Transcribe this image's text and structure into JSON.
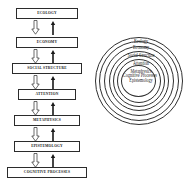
{
  "diagram": {
    "line_color": "#2b2b2b",
    "background_color": "#ffffff"
  },
  "flowchart": {
    "name": "hierarchical-flowchart",
    "down_arrow_style": "hollow-block-arrow",
    "up_arrow_style": "thin-solid-arrow",
    "boxes": [
      {
        "label": "ECOLOGY"
      },
      {
        "label": "ECONOMY"
      },
      {
        "label": "SOCIAL STRUCTURE"
      },
      {
        "label": "ATTENTION"
      },
      {
        "label": "METAPHYSICS"
      },
      {
        "label": "EPISTEMOLOGY"
      },
      {
        "label": "COGNITIVE PROCESSES"
      }
    ],
    "connectors": [
      {
        "down": "down-arrow",
        "up": "up-arrow"
      },
      {
        "down": "down-arrow",
        "up": "up-arrow"
      },
      {
        "down": "down-arrow",
        "up": "up-arrow"
      },
      {
        "down": "down-arrow",
        "up": "up-arrow"
      },
      {
        "down": "down-arrow",
        "up": "up-arrow"
      },
      {
        "down": "down-arrow",
        "up": "up-arrow"
      }
    ]
  },
  "circles": {
    "name": "concentric-circles",
    "rings": [
      {
        "label": "Ecology"
      },
      {
        "label": "Economy"
      },
      {
        "label": "Social Structure"
      },
      {
        "label": "Attention"
      },
      {
        "label": "Metaphysics"
      },
      {
        "label": "Epistemology"
      },
      {
        "label": "Cognitive Processes"
      }
    ]
  }
}
